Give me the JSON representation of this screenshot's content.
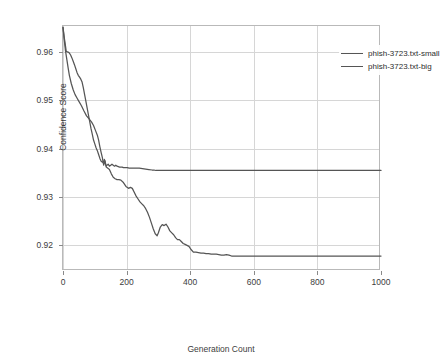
{
  "chart_data": {
    "type": "line",
    "title": "",
    "xlabel": "Generation Count",
    "ylabel": "Confidence Score",
    "xlim": [
      0,
      1000
    ],
    "ylim": [
      0.9147,
      0.9654
    ],
    "xticks": [
      "0",
      "200",
      "400",
      "600",
      "800",
      "1000"
    ],
    "xtick_values": [
      0,
      200,
      400,
      600,
      800,
      1000
    ],
    "yticks": [
      "0.92",
      "0.93",
      "0.94",
      "0.95",
      "0.96"
    ],
    "ytick_values": [
      0.92,
      0.93,
      0.94,
      0.95,
      0.96
    ],
    "grid": true,
    "legend_position": "top-right",
    "line_color": "#555555",
    "grid_color": "#d6d6d6",
    "axis_color": "#b9b9b9",
    "text_color": "#3c3c3c",
    "series": [
      {
        "name": "phish-3723.txt-small",
        "final_value": 0.9178,
        "x": [
          0,
          4,
          8,
          12,
          16,
          20,
          26,
          32,
          38,
          44,
          50,
          58,
          66,
          74,
          82,
          90,
          96,
          102,
          108,
          112,
          116,
          120,
          124,
          126,
          128,
          130,
          132,
          134,
          136,
          140,
          146,
          152,
          158,
          164,
          170,
          176,
          182,
          190,
          198,
          206,
          212,
          218,
          224,
          230,
          236,
          242,
          248,
          254,
          260,
          266,
          272,
          278,
          284,
          290,
          296,
          300,
          306,
          312,
          318,
          324,
          330,
          336,
          342,
          348,
          354,
          360,
          366,
          372,
          378,
          384,
          390,
          396,
          402,
          410,
          418,
          426,
          434,
          442,
          450,
          458,
          466,
          474,
          482,
          490,
          498,
          506,
          514,
          522,
          530,
          540,
          560,
          600,
          700,
          800,
          900,
          1000
        ],
        "y": [
          0.9651,
          0.9625,
          0.9602,
          0.9585,
          0.9568,
          0.9552,
          0.9535,
          0.9522,
          0.9512,
          0.9505,
          0.9498,
          0.9489,
          0.9478,
          0.9468,
          0.9462,
          0.9455,
          0.9448,
          0.9438,
          0.9428,
          0.9418,
          0.9404,
          0.9392,
          0.9381,
          0.9372,
          0.9366,
          0.9371,
          0.9375,
          0.9368,
          0.9362,
          0.936,
          0.9357,
          0.9348,
          0.9341,
          0.9338,
          0.9336,
          0.9336,
          0.9335,
          0.933,
          0.9322,
          0.9318,
          0.932,
          0.9318,
          0.931,
          0.9302,
          0.9296,
          0.929,
          0.9286,
          0.9282,
          0.9276,
          0.9268,
          0.9258,
          0.9246,
          0.9234,
          0.9224,
          0.922,
          0.9226,
          0.9238,
          0.9243,
          0.9241,
          0.9244,
          0.9238,
          0.923,
          0.9226,
          0.9222,
          0.9216,
          0.9212,
          0.9212,
          0.9208,
          0.9204,
          0.9202,
          0.92,
          0.9198,
          0.9192,
          0.9186,
          0.9186,
          0.9185,
          0.9184,
          0.9184,
          0.9183,
          0.9183,
          0.9182,
          0.9182,
          0.9182,
          0.9181,
          0.918,
          0.918,
          0.9181,
          0.918,
          0.9178,
          0.9178,
          0.9178,
          0.9178,
          0.9178,
          0.9178,
          0.9178,
          0.9178
        ]
      },
      {
        "name": "phish-3723.txt-big",
        "final_value": 0.9355,
        "x": [
          0,
          4,
          8,
          10,
          12,
          16,
          20,
          24,
          28,
          32,
          36,
          40,
          44,
          48,
          52,
          56,
          60,
          64,
          68,
          72,
          76,
          80,
          84,
          88,
          92,
          96,
          100,
          104,
          108,
          112,
          116,
          120,
          124,
          128,
          130,
          132,
          134,
          136,
          138,
          142,
          146,
          150,
          154,
          158,
          162,
          166,
          170,
          174,
          178,
          182,
          186,
          190,
          196,
          202,
          208,
          214,
          220,
          230,
          240,
          250,
          260,
          270,
          280,
          286,
          292,
          300,
          350,
          400,
          500,
          600,
          700,
          800,
          900,
          1000
        ],
        "y": [
          0.9651,
          0.963,
          0.9612,
          0.9602,
          0.9601,
          0.96,
          0.9598,
          0.9594,
          0.9588,
          0.9581,
          0.9574,
          0.9566,
          0.9558,
          0.9552,
          0.9548,
          0.9544,
          0.9538,
          0.9526,
          0.9512,
          0.9498,
          0.9484,
          0.947,
          0.9456,
          0.9442,
          0.943,
          0.9418,
          0.941,
          0.9402,
          0.9396,
          0.9388,
          0.938,
          0.9374,
          0.9372,
          0.9374,
          0.9378,
          0.9374,
          0.9368,
          0.9364,
          0.9366,
          0.9368,
          0.9364,
          0.9366,
          0.9368,
          0.9366,
          0.9364,
          0.9366,
          0.9364,
          0.9363,
          0.9362,
          0.9362,
          0.9362,
          0.9361,
          0.9361,
          0.9361,
          0.936,
          0.936,
          0.936,
          0.936,
          0.936,
          0.9359,
          0.9358,
          0.9357,
          0.9356,
          0.9356,
          0.9355,
          0.9355,
          0.9355,
          0.9355,
          0.9355,
          0.9355,
          0.9355,
          0.9355,
          0.9355,
          0.9355
        ]
      }
    ]
  },
  "legend": {
    "items": [
      {
        "label": "phish-3723.txt-small"
      },
      {
        "label": "phish-3723.txt-big"
      }
    ]
  }
}
